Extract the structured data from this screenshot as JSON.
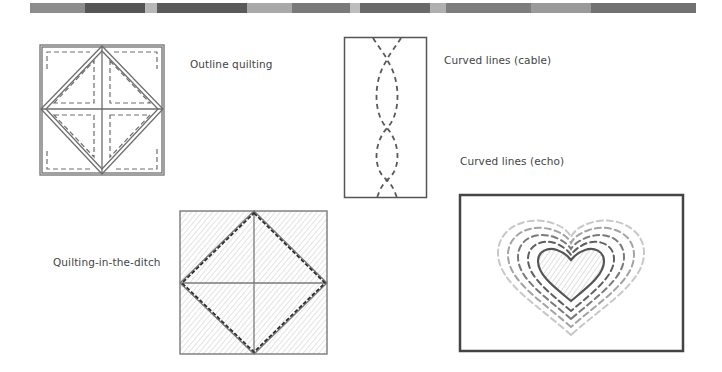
{
  "header_band": {
    "segments": [
      {
        "color": "#8d8d8d",
        "width": 55
      },
      {
        "color": "#555555",
        "width": 60
      },
      {
        "color": "#b8b8b8",
        "width": 12
      },
      {
        "color": "#5a5a5a",
        "width": 90
      },
      {
        "color": "#a9a9a9",
        "width": 45
      },
      {
        "color": "#7a7a7a",
        "width": 58
      },
      {
        "color": "#bdbdbd",
        "width": 10
      },
      {
        "color": "#6a6a6a",
        "width": 70
      },
      {
        "color": "#b0b0b0",
        "width": 16
      },
      {
        "color": "#7e7e7e",
        "width": 85
      },
      {
        "color": "#9a9a9a",
        "width": 60
      },
      {
        "color": "#727272",
        "width": 105
      }
    ]
  },
  "figures": {
    "outline": {
      "label": "Outline quilting"
    },
    "cable": {
      "label": "Curved lines (cable)"
    },
    "echo": {
      "label": "Curved lines (echo)"
    },
    "ditch": {
      "label": "Quilting-in-the-ditch"
    }
  },
  "colors": {
    "line_dark": "#4a4a4a",
    "line_mid": "#6e6e6e",
    "line_light": "#b5b5b5",
    "hatch": "#d2d2d2"
  }
}
